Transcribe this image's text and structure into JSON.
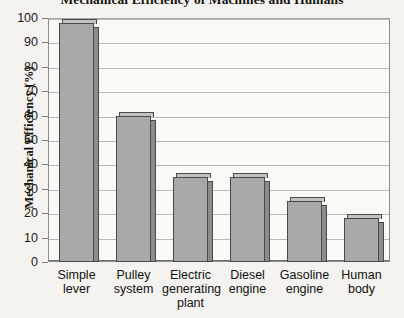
{
  "chart_data": {
    "type": "bar",
    "title": "Mechanical Efficiency of Machines and Humans",
    "xlabel": "",
    "ylabel": "Mechanical Efficiency (%)",
    "categories": [
      "Simple lever",
      "Pulley system",
      "Electric generating plant",
      "Diesel engine",
      "Gasoline engine",
      "Human body"
    ],
    "category_lines": [
      [
        "Simple",
        "lever"
      ],
      [
        "Pulley",
        "system"
      ],
      [
        "Electric",
        "generating",
        "plant"
      ],
      [
        "Diesel",
        "engine"
      ],
      [
        "Gasoline",
        "engine"
      ],
      [
        "Human",
        "body"
      ]
    ],
    "values": [
      98,
      60,
      35,
      35,
      25,
      18
    ],
    "ylim": [
      0,
      100
    ],
    "yticks": [
      0,
      10,
      20,
      30,
      40,
      50,
      60,
      70,
      80,
      90,
      100
    ],
    "ytick_labels": [
      "0",
      "10",
      "20",
      "30",
      "40",
      "50",
      "60",
      "70",
      "80",
      "90",
      "100"
    ],
    "grid": true,
    "legend": false,
    "bar_color": "#a9a9a9",
    "bar_edge_color": "#4a4a4a",
    "background_color": "#f4f3ef",
    "plot_background_color": "#fbfaf7",
    "gridline_color": "#b9b9b9"
  }
}
